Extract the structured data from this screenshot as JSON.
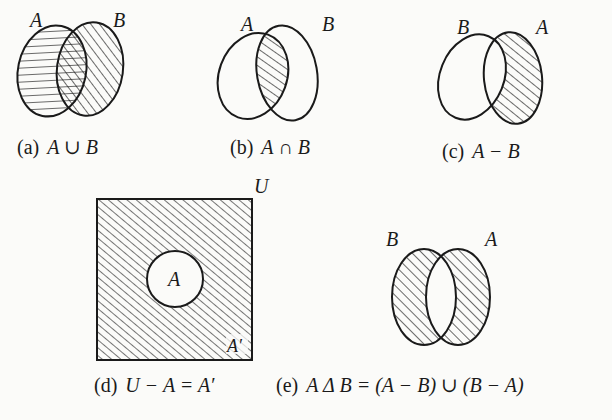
{
  "diagram": {
    "figures": [
      {
        "id": "a",
        "tag": "(a)",
        "expression": "A ∪ B",
        "set_labels": [
          "A",
          "B"
        ],
        "shaded": "A ∪ B"
      },
      {
        "id": "b",
        "tag": "(b)",
        "expression": "A ∩ B",
        "set_labels": [
          "A",
          "B"
        ],
        "shaded": "A ∩ B"
      },
      {
        "id": "c",
        "tag": "(c)",
        "expression": "A − B",
        "set_labels": [
          "B",
          "A"
        ],
        "shaded": "A − B"
      },
      {
        "id": "d",
        "tag": "(d)",
        "expression": "U − A = A′",
        "set_labels": [
          "U",
          "A",
          "A′"
        ],
        "shaded": "A′"
      },
      {
        "id": "e",
        "tag": "(e)",
        "expression": "A Δ B = (A − B) ∪ (B − A)",
        "set_labels": [
          "B",
          "A"
        ],
        "shaded": "A Δ B"
      }
    ],
    "colors": {
      "ink": "#1a1a1a",
      "paper": "#fbfbf9"
    }
  }
}
